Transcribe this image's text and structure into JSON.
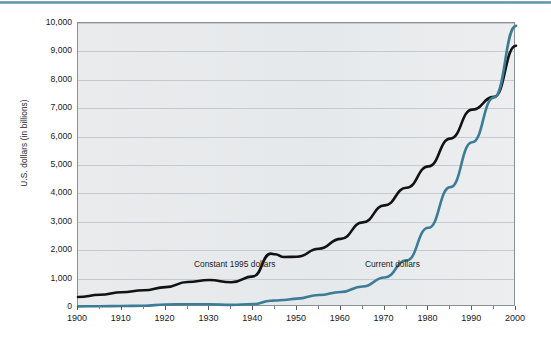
{
  "figure": {
    "name": "us-dollars-line-chart",
    "top_rule_color": "#5d93ad",
    "plot_background": "#e7eaec",
    "grid_color": "#c6cace"
  },
  "chart_data": {
    "type": "line",
    "title": "",
    "subtitle": "",
    "xlabel": "",
    "ylabel": "U.S. dollars (in billions)",
    "xlim": [
      1900,
      2000
    ],
    "ylim": [
      0,
      10000
    ],
    "grid": true,
    "grid_axis": "y",
    "legend_position": "inline-annotations",
    "x_ticks": [
      1900,
      1910,
      1920,
      1930,
      1940,
      1950,
      1960,
      1970,
      1980,
      1990,
      2000
    ],
    "x_tick_labels": [
      "1900",
      "1910",
      "1920",
      "1930",
      "1940",
      "1950",
      "1960",
      "1970",
      "1980",
      "1990",
      "2000"
    ],
    "y_ticks": [
      0,
      1000,
      2000,
      3000,
      4000,
      5000,
      6000,
      7000,
      8000,
      9000,
      10000
    ],
    "y_tick_labels": [
      "0",
      "1,000",
      "2,000",
      "3,000",
      "4,000",
      "5,000",
      "6,000",
      "7,000",
      "8,000",
      "9,000",
      "10,000"
    ],
    "x": [
      1900,
      1905,
      1910,
      1915,
      1920,
      1925,
      1930,
      1935,
      1940,
      1944,
      1945,
      1947,
      1950,
      1955,
      1960,
      1965,
      1970,
      1975,
      1980,
      1985,
      1990,
      1995,
      2000
    ],
    "series": [
      {
        "name": "Constant 1995 dollars",
        "color": "#121212",
        "width": 2.6,
        "label_x": 1936,
        "label_y": 1450,
        "values": [
          350,
          430,
          520,
          590,
          700,
          880,
          950,
          870,
          1080,
          1880,
          1860,
          1760,
          1770,
          2050,
          2400,
          2980,
          3580,
          4200,
          4950,
          5930,
          6950,
          7400,
          9200
        ]
      },
      {
        "name": "Current dollars",
        "color": "#3d7b96",
        "width": 2.6,
        "label_x": 1972,
        "label_y": 1450,
        "values": [
          20,
          28,
          35,
          42,
          90,
          95,
          95,
          75,
          100,
          220,
          230,
          245,
          295,
          420,
          530,
          720,
          1040,
          1640,
          2790,
          4220,
          5800,
          7380,
          9900
        ]
      }
    ],
    "annotations": [
      {
        "text": "Constant 1995 dollars",
        "series": "Constant 1995 dollars"
      },
      {
        "text": "Current dollars",
        "series": "Current dollars"
      }
    ]
  }
}
